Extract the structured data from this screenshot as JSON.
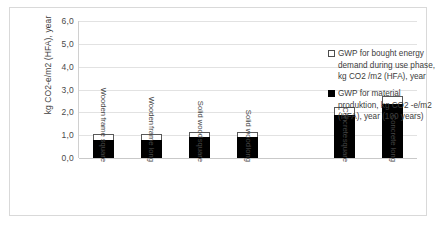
{
  "chart_data": {
    "type": "bar",
    "title": "",
    "xlabel": "",
    "ylabel": "kg CO2-e/m2 (HFA), year",
    "ylim": [
      0,
      6
    ],
    "ytick_labels": [
      "6,0",
      "5,0",
      "4,0",
      "3,0",
      "2,0",
      "1,0",
      "0,0"
    ],
    "ytick_values": [
      6,
      5,
      4,
      3,
      2,
      1,
      0
    ],
    "grid": true,
    "stacked": true,
    "legend_position": "right",
    "categories": [
      "Wooden frame square",
      "Wooden frame long",
      "Solid wood square",
      "Solid wood long",
      "",
      "Concrete square",
      "Concrete long"
    ],
    "category_lines": [
      [
        "Wooden",
        "frame square"
      ],
      [
        "Wooden",
        "frame long"
      ],
      [
        "Solid wood",
        "square"
      ],
      [
        "Solid wood",
        "long"
      ],
      [
        ""
      ],
      [
        "Concrete",
        "square"
      ],
      [
        "Concrete long"
      ]
    ],
    "series": [
      {
        "name": "GWP for material produktion, kg CO2 -e/m2 (HFA), year (100 years)",
        "short_name": "material-production",
        "color": "#000000",
        "values": [
          0.8,
          0.8,
          0.9,
          0.9,
          null,
          1.9,
          2.35
        ]
      },
      {
        "name": "GWP for bought energy demand during use phase, kg CO2 /m2 (HFA), year",
        "short_name": "bought-energy-use-phase",
        "color": "#ffffff",
        "values": [
          0.25,
          0.25,
          0.25,
          0.25,
          null,
          0.35,
          0.35
        ]
      }
    ],
    "totals": [
      1.05,
      1.05,
      1.15,
      1.15,
      null,
      2.25,
      2.7
    ]
  },
  "legend": {
    "items": [
      {
        "marker": "open-square-swatch",
        "label": "GWP for bought energy demand during use phase, kg CO2 /m2 (HFA), year"
      },
      {
        "marker": "filled-square-swatch",
        "label": "GWP for material produktion, kg CO2 -e/m2 (HFA), year (100 years)"
      }
    ]
  },
  "colors": {
    "material_production": "#000000",
    "bought_energy": "#ffffff",
    "bar_outline": "#595959",
    "gridline": "#e2e2e2",
    "frame_border": "#d9d9d9",
    "text": "#3f3f3f"
  }
}
